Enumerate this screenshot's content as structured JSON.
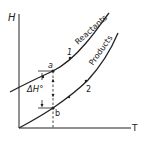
{
  "diagram": {
    "axes": {
      "y_label": "H",
      "x_label": "T"
    },
    "curves": [
      {
        "name": "reactants",
        "label": "Reactants"
      },
      {
        "name": "products",
        "label": "Products"
      }
    ],
    "points": {
      "a": "a",
      "b": "b",
      "one": "1",
      "two": "2"
    },
    "delta_label": "ΔH°",
    "colors": {
      "line": "#222222",
      "background": "#ffffff"
    }
  }
}
